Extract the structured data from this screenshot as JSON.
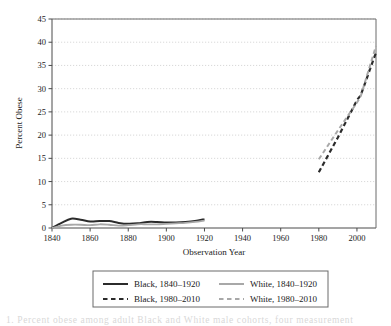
{
  "figure": {
    "caption_partial": "1.   Percent obese among adult Black and White male cohorts, four measurement"
  },
  "chart_data": {
    "type": "line",
    "title": "",
    "xlabel": "Observation Year",
    "ylabel": "Percent Obese",
    "xlim": [
      1840,
      2010
    ],
    "ylim": [
      0,
      45
    ],
    "xticks": [
      1840,
      1860,
      1880,
      1900,
      1920,
      1940,
      1960,
      1980,
      2000
    ],
    "yticks": [
      0,
      5,
      10,
      15,
      20,
      25,
      30,
      35,
      40,
      45
    ],
    "grid": "horizontal-dotted",
    "legend_position": "below-axes",
    "series": [
      {
        "name": "Black, 1840–1920",
        "style": "solid",
        "color": "#2b2b2b",
        "width": 2.0,
        "x": [
          1840,
          1845,
          1850,
          1855,
          1860,
          1865,
          1870,
          1875,
          1880,
          1885,
          1890,
          1895,
          1900,
          1905,
          1910,
          1915,
          1920
        ],
        "y": [
          0.0,
          1.1,
          2.0,
          1.8,
          1.4,
          1.5,
          1.5,
          1.1,
          0.9,
          1.0,
          1.3,
          1.3,
          1.2,
          1.2,
          1.3,
          1.5,
          1.9
        ]
      },
      {
        "name": "White, 1840–1920",
        "style": "solid",
        "color": "#a8a8a8",
        "width": 1.8,
        "x": [
          1840,
          1845,
          1850,
          1855,
          1860,
          1865,
          1870,
          1875,
          1880,
          1885,
          1890,
          1895,
          1900,
          1905,
          1910,
          1915,
          1920
        ],
        "y": [
          0.0,
          0.5,
          0.7,
          0.7,
          0.6,
          0.8,
          0.7,
          0.5,
          0.6,
          0.8,
          0.8,
          0.8,
          0.9,
          1.0,
          1.1,
          1.3,
          1.6
        ]
      },
      {
        "name": "Black, 1980–2010",
        "style": "dashed",
        "color": "#2b2b2b",
        "width": 2.2,
        "x": [
          1980,
          1990,
          2000,
          2002,
          2010
        ],
        "y": [
          12.0,
          19.5,
          27.5,
          28.6,
          37.8
        ]
      },
      {
        "name": "White, 1980–2010",
        "style": "dashed",
        "color": "#a8a8a8",
        "width": 2.0,
        "x": [
          1980,
          1990,
          2000,
          2002,
          2010
        ],
        "y": [
          14.8,
          21.0,
          27.0,
          28.4,
          39.2
        ]
      }
    ]
  },
  "legend": {
    "entries": [
      {
        "label": "Black, 1840–1920",
        "style": "solid",
        "color": "#2b2b2b"
      },
      {
        "label": "White, 1840–1920",
        "style": "solid",
        "color": "#a8a8a8"
      },
      {
        "label": "Black, 1980–2010",
        "style": "dashed",
        "color": "#2b2b2b"
      },
      {
        "label": "White, 1980–2010",
        "style": "dashed",
        "color": "#a8a8a8"
      }
    ]
  }
}
